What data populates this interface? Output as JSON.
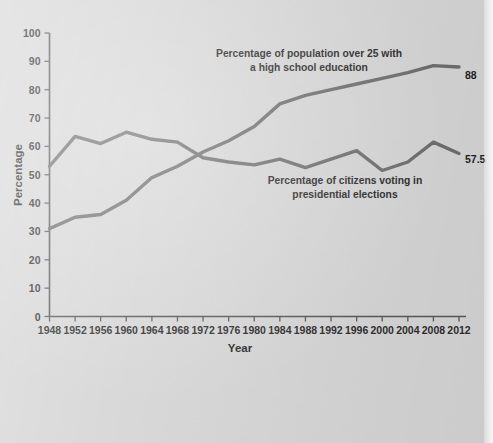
{
  "figure": {
    "background_color": "#d6d6d6",
    "line_color": "#6e6e6e",
    "axis_color": "#585858",
    "text_color": "#2b2b2b"
  },
  "chart_data": {
    "type": "line",
    "title": "",
    "xlabel": "Year",
    "ylabel": "Percentage",
    "xlim": [
      1948,
      2012
    ],
    "ylim": [
      0,
      100
    ],
    "grid": false,
    "legend_position": "inline-annotations",
    "x": [
      1948,
      1952,
      1956,
      1960,
      1964,
      1968,
      1972,
      1976,
      1980,
      1984,
      1988,
      1992,
      1996,
      2000,
      2004,
      2008,
      2012
    ],
    "xtick_labels": [
      "1948",
      "1952",
      "1956",
      "1960",
      "1964",
      "1968",
      "1972",
      "1976",
      "1980",
      "1984",
      "1988",
      "1992",
      "1996",
      "2000",
      "2004",
      "2008",
      "2012"
    ],
    "ytick_labels": [
      "0",
      "10",
      "20",
      "30",
      "40",
      "50",
      "60",
      "70",
      "80",
      "90",
      "100"
    ],
    "ytick_values": [
      0,
      10,
      20,
      30,
      40,
      50,
      60,
      70,
      80,
      90,
      100
    ],
    "series": [
      {
        "name": "Percentage of population over 25 with a high school education",
        "values": [
          31,
          35,
          36,
          41,
          49,
          53,
          58,
          62,
          67,
          75,
          78,
          80,
          82,
          84,
          86,
          88.5,
          88
        ],
        "end_label": "88"
      },
      {
        "name": "Percentage of citizens voting in presidential elections",
        "values": [
          53,
          63.5,
          61,
          65,
          62.5,
          61.5,
          56,
          54.5,
          53.5,
          55.5,
          52.5,
          55.5,
          58.5,
          51.5,
          54.5,
          61.5,
          57.5
        ],
        "end_label": "57.5"
      }
    ],
    "annotations": [
      {
        "id": "education-annotation",
        "lines": [
          "Percentage of population over 25 with",
          "a high school education"
        ]
      },
      {
        "id": "voting-annotation",
        "lines": [
          "Percentage of citizens voting in",
          "presidential elections"
        ]
      }
    ]
  }
}
